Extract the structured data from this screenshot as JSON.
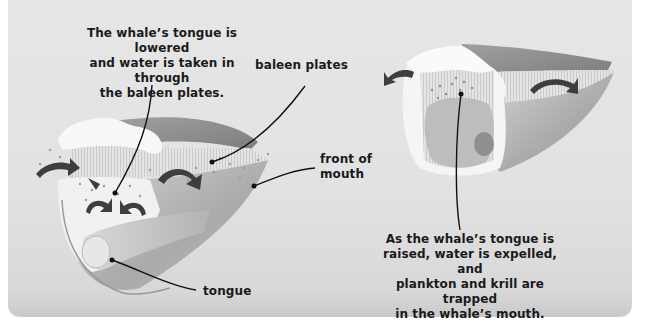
{
  "diagram": {
    "panel_background": "#e4e4e4",
    "left_view": {
      "name": "tongue-lowered-view",
      "caption": "The whale’s tongue is lowered and water is taken in through the baleen plates.",
      "caption_lines": [
        "The whale’s tongue is lowered",
        "and water is taken in through",
        "the baleen plates."
      ],
      "labels": {
        "baleen_plates": "baleen plates",
        "front_of_mouth_lines": [
          "front of",
          "mouth"
        ],
        "tongue": "tongue"
      },
      "arrows": "water flowing inward"
    },
    "right_view": {
      "name": "tongue-raised-view",
      "caption": "As the whale’s tongue is raised, water is expelled, and plankton and krill are trapped in the whale’s mouth.",
      "caption_lines": [
        "As the whale’s tongue is",
        "raised, water is expelled, and",
        "plankton and krill are trapped",
        "in the whale’s mouth."
      ],
      "arrows": "water flowing outward"
    },
    "colors": {
      "text": "#1a1a1a",
      "leader_line": "#111111",
      "arrow": "#3a3a3a",
      "jaw_dark": "#8a8a8a",
      "jaw_light": "#bdbdbd",
      "baleen": "#dcdcdc",
      "gum": "#f7f7f7"
    }
  }
}
